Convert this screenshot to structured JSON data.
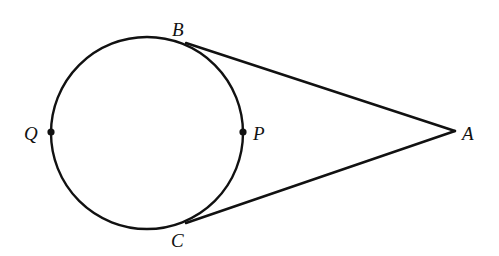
{
  "diagram": {
    "type": "geometry",
    "stroke_color": "#111111",
    "background": "#ffffff",
    "circle": {
      "cx": 147,
      "cy": 133,
      "r": 96
    },
    "points": {
      "A": {
        "label": "A",
        "x": 455,
        "y": 131
      },
      "B": {
        "label": "B",
        "x": 186,
        "y": 43
      },
      "C": {
        "label": "C",
        "x": 186,
        "y": 223
      },
      "P": {
        "label": "P",
        "x": 243,
        "y": 132
      },
      "Q": {
        "label": "Q",
        "x": 51,
        "y": 132
      }
    },
    "segments": [
      {
        "from": "A",
        "to": "B"
      },
      {
        "from": "A",
        "to": "C"
      }
    ],
    "marked_points": [
      "P",
      "Q"
    ],
    "labels": {
      "A": "A",
      "B": "B",
      "C": "C",
      "P": "P",
      "Q": "Q"
    }
  }
}
